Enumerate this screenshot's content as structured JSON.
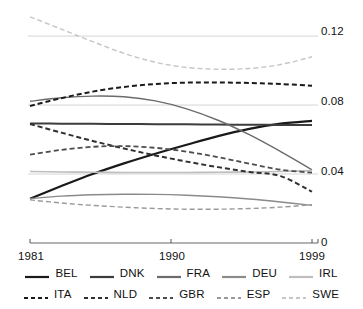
{
  "chart_data": {
    "type": "line",
    "title": "",
    "xlabel": "",
    "ylabel": "",
    "xlim": [
      1981,
      1999
    ],
    "ylim": [
      0,
      0.135
    ],
    "grid": true,
    "gridlines": [
      0.04,
      0.08,
      0.12
    ],
    "x_ticks": [
      "1981",
      "1990",
      "1999"
    ],
    "x_tick_values": [
      1981,
      1990,
      1999
    ],
    "y_ticks": [
      "0",
      "0.04",
      "0.08",
      "0.12"
    ],
    "y_tick_values": [
      0,
      0.04,
      0.08,
      0.12
    ],
    "legend_position": "bottom",
    "x": [
      1981,
      1983,
      1985,
      1987,
      1989,
      1991,
      1993,
      1995,
      1997,
      1999
    ],
    "series": [
      {
        "name": "BEL",
        "style": "solid",
        "color": "#1a1a1a",
        "width": 2.2,
        "values": [
          0.0257,
          0.033,
          0.04,
          0.0462,
          0.0518,
          0.057,
          0.062,
          0.0662,
          0.0692,
          0.0708
        ]
      },
      {
        "name": "DNK",
        "style": "solid",
        "color": "#3c3c3c",
        "width": 2.0,
        "values": [
          0.0693,
          0.0692,
          0.0691,
          0.069,
          0.0689,
          0.0688,
          0.0687,
          0.0686,
          0.0685,
          0.0684
        ]
      },
      {
        "name": "FRA",
        "style": "solid",
        "color": "#6b6b6b",
        "width": 1.4,
        "values": [
          0.0822,
          0.0842,
          0.0852,
          0.0848,
          0.0824,
          0.0778,
          0.0712,
          0.0628,
          0.053,
          0.0425
        ]
      },
      {
        "name": "DEU",
        "style": "solid",
        "color": "#8a8a8a",
        "width": 1.4,
        "values": [
          0.0257,
          0.0272,
          0.028,
          0.0283,
          0.0282,
          0.0277,
          0.0268,
          0.0255,
          0.0238,
          0.0218
        ]
      },
      {
        "name": "IRL",
        "style": "solid",
        "color": "#bdbdbd",
        "width": 1.6,
        "values": [
          0.0415,
          0.0412,
          0.041,
          0.0409,
          0.0409,
          0.0409,
          0.041,
          0.0412,
          0.0415,
          0.042
        ]
      },
      {
        "name": "ITA",
        "style": "dashed",
        "color": "#1a1a1a",
        "width": 2.0,
        "values": [
          0.0795,
          0.084,
          0.0878,
          0.0905,
          0.0922,
          0.093,
          0.0931,
          0.0928,
          0.0922,
          0.0912
        ]
      },
      {
        "name": "NLD",
        "style": "dashed",
        "color": "#303030",
        "width": 2.0,
        "values": [
          0.069,
          0.064,
          0.0592,
          0.0548,
          0.0508,
          0.0472,
          0.044,
          0.0412,
          0.0388,
          0.0298
        ]
      },
      {
        "name": "GBR",
        "style": "dashed",
        "color": "#4d4d4d",
        "width": 1.8,
        "values": [
          0.0512,
          0.054,
          0.0558,
          0.0562,
          0.0552,
          0.053,
          0.0498,
          0.046,
          0.0425,
          0.0408
        ]
      },
      {
        "name": "ESP",
        "style": "dashed",
        "color": "#9a9a9a",
        "width": 1.4,
        "values": [
          0.025,
          0.0232,
          0.0218,
          0.0208,
          0.02,
          0.0196,
          0.0196,
          0.02,
          0.0208,
          0.0222
        ]
      },
      {
        "name": "SWE",
        "style": "dashed",
        "color": "#c6c6c6",
        "width": 1.4,
        "values": [
          0.1312,
          0.124,
          0.1168,
          0.11,
          0.1048,
          0.1018,
          0.1008,
          0.1012,
          0.1035,
          0.108
        ]
      }
    ]
  },
  "axes": {
    "y_tick_0": "0",
    "y_tick_1": "0.04",
    "y_tick_2": "0.08",
    "y_tick_3": "0.12",
    "x_tick_0": "1981",
    "x_tick_1": "1990",
    "x_tick_2": "1999"
  },
  "legend": {
    "row1": [
      {
        "label": "BEL",
        "color": "#1a1a1a",
        "style": "solid"
      },
      {
        "label": "DNK",
        "color": "#3c3c3c",
        "style": "solid"
      },
      {
        "label": "FRA",
        "color": "#6b6b6b",
        "style": "solid"
      },
      {
        "label": "DEU",
        "color": "#8a8a8a",
        "style": "solid"
      },
      {
        "label": "IRL",
        "color": "#bdbdbd",
        "style": "solid"
      }
    ],
    "row2": [
      {
        "label": "ITA",
        "color": "#1a1a1a",
        "style": "dashed"
      },
      {
        "label": "NLD",
        "color": "#303030",
        "style": "dashed"
      },
      {
        "label": "GBR",
        "color": "#4d4d4d",
        "style": "dashed"
      },
      {
        "label": "ESP",
        "color": "#9a9a9a",
        "style": "dashed"
      },
      {
        "label": "SWE",
        "color": "#c6c6c6",
        "style": "dashed"
      }
    ]
  },
  "colors": {
    "background": "#ffffff",
    "grid": "#d5d5d5",
    "axis": "#9a9a9a",
    "text": "#111111"
  }
}
